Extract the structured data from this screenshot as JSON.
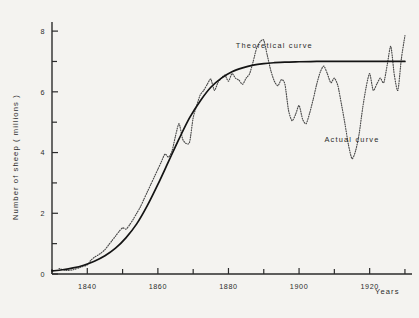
{
  "chart_data": {
    "type": "line",
    "title": "",
    "xlabel": "Years",
    "ylabel": "Number of sheep  ( millions )",
    "xlim": [
      1830,
      1932
    ],
    "ylim": [
      0,
      8.3
    ],
    "grid": false,
    "legend_position": "inline-annotations",
    "x_ticks_major": [
      1840,
      1860,
      1880,
      1900,
      1920
    ],
    "x_tick_labels": [
      "1840",
      "1860",
      "1880",
      "1900",
      "1920"
    ],
    "x_ticks_minor": [
      1830,
      1850,
      1870,
      1890,
      1910,
      1930
    ],
    "y_ticks_major": [
      0,
      2,
      4,
      6,
      8
    ],
    "y_tick_labels": [
      "0",
      "2",
      "4",
      "6",
      "8"
    ],
    "y_ticks_minor": [
      1,
      3,
      5,
      7
    ],
    "annotations": [
      {
        "name": "theoretical-curve-label",
        "text": "Theoretical  curve",
        "x": 1893,
        "y": 7.45
      },
      {
        "name": "actual-curve-label",
        "text": "Actual  curve",
        "x": 1915,
        "y": 4.35
      }
    ],
    "series": [
      {
        "name": "Theoretical curve",
        "style": "solid",
        "asymptote": 7.0,
        "x": [
          1830,
          1833,
          1836,
          1839,
          1842,
          1845,
          1848,
          1851,
          1854,
          1857,
          1860,
          1863,
          1866,
          1869,
          1872,
          1875,
          1878,
          1881,
          1884,
          1887,
          1890,
          1893,
          1896,
          1900,
          1905,
          1910,
          1915,
          1920,
          1925,
          1930
        ],
        "values": [
          0.1,
          0.14,
          0.2,
          0.29,
          0.42,
          0.6,
          0.85,
          1.2,
          1.65,
          2.25,
          2.95,
          3.7,
          4.45,
          5.15,
          5.7,
          6.15,
          6.45,
          6.66,
          6.79,
          6.88,
          6.93,
          6.96,
          6.98,
          6.99,
          7.0,
          7.0,
          7.0,
          7.0,
          7.0,
          7.0
        ]
      },
      {
        "name": "Actual curve",
        "style": "dotted",
        "x": [
          1832,
          1834,
          1836,
          1838,
          1840,
          1841,
          1842,
          1843,
          1844,
          1845,
          1846,
          1847,
          1848,
          1849,
          1850,
          1851,
          1852,
          1853,
          1854,
          1855,
          1856,
          1857,
          1858,
          1859,
          1860,
          1861,
          1862,
          1863,
          1864,
          1865,
          1866,
          1867,
          1868,
          1869,
          1870,
          1871,
          1872,
          1873,
          1874,
          1875,
          1876,
          1877,
          1878,
          1879,
          1880,
          1881,
          1882,
          1883,
          1884,
          1885,
          1886,
          1887,
          1888,
          1889,
          1890,
          1891,
          1892,
          1893,
          1894,
          1895,
          1896,
          1897,
          1898,
          1899,
          1900,
          1901,
          1902,
          1903,
          1904,
          1905,
          1906,
          1907,
          1908,
          1909,
          1910,
          1911,
          1912,
          1913,
          1914,
          1915,
          1916,
          1917,
          1918,
          1919,
          1920,
          1921,
          1922,
          1923,
          1924,
          1925,
          1926,
          1927,
          1928,
          1929,
          1930
        ],
        "values": [
          0.18,
          0.12,
          0.14,
          0.22,
          0.3,
          0.45,
          0.55,
          0.62,
          0.7,
          0.8,
          0.95,
          1.1,
          1.25,
          1.4,
          1.52,
          1.48,
          1.62,
          1.8,
          2.0,
          2.2,
          2.45,
          2.7,
          2.95,
          3.2,
          3.45,
          3.7,
          3.95,
          3.85,
          4.05,
          4.55,
          4.95,
          4.45,
          4.3,
          4.35,
          5.15,
          5.55,
          5.9,
          6.05,
          6.25,
          6.42,
          6.05,
          6.3,
          6.45,
          6.55,
          6.35,
          6.6,
          6.45,
          6.38,
          6.25,
          6.45,
          6.6,
          7.0,
          7.45,
          7.65,
          7.7,
          7.2,
          6.7,
          6.35,
          6.2,
          6.4,
          6.25,
          5.4,
          5.05,
          5.25,
          5.55,
          5.1,
          4.95,
          5.3,
          5.75,
          6.25,
          6.65,
          6.85,
          6.6,
          6.3,
          6.45,
          6.2,
          5.6,
          4.95,
          4.25,
          3.8,
          4.05,
          4.6,
          5.45,
          6.15,
          6.6,
          6.05,
          6.25,
          6.45,
          6.3,
          6.9,
          7.5,
          6.55,
          6.05,
          7.1,
          7.85
        ]
      }
    ]
  }
}
